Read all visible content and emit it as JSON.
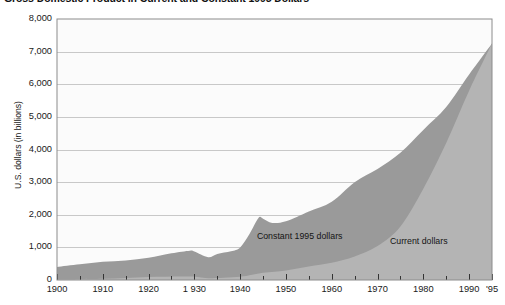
{
  "chart_data": {
    "type": "area",
    "title": "Gross Domestic Product in Current and Constant 1995 Dollars",
    "xlabel": "",
    "ylabel": "U.S. dollars (in billions)",
    "xlim": [
      1900,
      1995
    ],
    "ylim": [
      0,
      8000
    ],
    "grid": true,
    "legend_position": "inline-annotation",
    "y_ticks": [
      {
        "value": 8000,
        "label": "8,000"
      },
      {
        "value": 7000,
        "label": "7,000"
      },
      {
        "value": 6000,
        "label": "6,000"
      },
      {
        "value": 5000,
        "label": "5,000"
      },
      {
        "value": 4000,
        "label": "4,000"
      },
      {
        "value": 3000,
        "label": "3,000"
      },
      {
        "value": 2000,
        "label": "2,000"
      },
      {
        "value": 1000,
        "label": "1,000"
      },
      {
        "value": 0,
        "label": "0"
      }
    ],
    "x_ticks": [
      {
        "value": 1900,
        "label": "1900"
      },
      {
        "value": 1910,
        "label": "1910"
      },
      {
        "value": 1920,
        "label": "1920"
      },
      {
        "value": 1930,
        "label": "1 930"
      },
      {
        "value": 1940,
        "label": "1940"
      },
      {
        "value": 1950,
        "label": "1950"
      },
      {
        "value": 1960,
        "label": "1960"
      },
      {
        "value": 1970,
        "label": "1970"
      },
      {
        "value": 1980,
        "label": "1980"
      },
      {
        "value": 1990,
        "label": "1990"
      },
      {
        "value": 1995,
        "label": "'95"
      }
    ],
    "x_minor_tick_interval": 5,
    "series": [
      {
        "name": "Constant 1995 dollars",
        "color": "#9a9a9a",
        "annotation": "Constant 1995 dollars",
        "x": [
          1900,
          1905,
          1910,
          1915,
          1920,
          1925,
          1929,
          1930,
          1933,
          1935,
          1938,
          1940,
          1942,
          1944,
          1945,
          1947,
          1950,
          1955,
          1960,
          1965,
          1970,
          1975,
          1980,
          1985,
          1990,
          1995
        ],
        "values": [
          400,
          480,
          560,
          600,
          680,
          820,
          900,
          870,
          700,
          800,
          880,
          1000,
          1400,
          1900,
          1880,
          1750,
          1800,
          2100,
          2400,
          3000,
          3400,
          3900,
          4600,
          5300,
          6300,
          7250
        ]
      },
      {
        "name": "Current dollars",
        "color": "#b4b4b4",
        "annotation": "Current dollars",
        "x": [
          1900,
          1910,
          1920,
          1929,
          1933,
          1940,
          1945,
          1950,
          1955,
          1960,
          1965,
          1970,
          1975,
          1980,
          1985,
          1990,
          1995
        ],
        "values": [
          20,
          35,
          90,
          105,
          57,
          100,
          223,
          294,
          415,
          527,
          720,
          1040,
          1640,
          2800,
          4200,
          5800,
          7250
        ]
      }
    ],
    "annotations": [
      {
        "text": "Constant 1995 dollars",
        "x": 1953,
        "y": 1320
      },
      {
        "text": "Current dollars",
        "x": 1979,
        "y": 1180
      }
    ],
    "colors": {
      "constant_dollars": "#9a9a9a",
      "current_dollars": "#b4b4b4",
      "plot_background": "#fbfbfb",
      "gridline": "#c8c8c8",
      "axis_border": "#8c8c8c",
      "text": "#1a1a1a"
    }
  },
  "geometry": {
    "plot_left": 57,
    "plot_right": 492,
    "plot_top": 19,
    "plot_bottom": 280
  }
}
